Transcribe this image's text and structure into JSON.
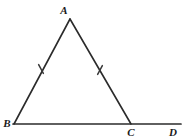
{
  "figure": {
    "type": "geometry-diagram",
    "background_color": "#ffffff",
    "stroke_color": "#2b2b2b",
    "label_color": "#1a1a1a",
    "vertices": [
      {
        "name": "A",
        "label": "A",
        "x": 70,
        "y": 19,
        "label_x": 64,
        "label_y": 14
      },
      {
        "name": "B",
        "label": "B",
        "x": 14,
        "y": 124,
        "label_x": 7,
        "label_y": 126
      },
      {
        "name": "C",
        "label": "C",
        "x": 131,
        "y": 124,
        "label_x": 131,
        "label_y": 136
      },
      {
        "name": "D",
        "label": "D",
        "x": 181,
        "y": 124,
        "label_x": 172,
        "label_y": 136
      }
    ],
    "segments": [
      {
        "name": "side-ab",
        "from": "A",
        "to": "B",
        "x1": 70,
        "y1": 19,
        "x2": 14,
        "y2": 124
      },
      {
        "name": "side-ac",
        "from": "A",
        "to": "C",
        "x1": 70,
        "y1": 19,
        "x2": 131,
        "y2": 124
      },
      {
        "name": "base-bd",
        "from": "B",
        "to": "D",
        "x1": 13,
        "y1": 124,
        "x2": 181,
        "y2": 124
      }
    ],
    "tick_marks": [
      {
        "name": "tick-ab",
        "on_segment": "side-ab",
        "x": 41,
        "y": 69,
        "angle": -28
      },
      {
        "name": "tick-ac",
        "on_segment": "side-ac",
        "x": 100,
        "y": 70,
        "angle": 28
      }
    ]
  }
}
